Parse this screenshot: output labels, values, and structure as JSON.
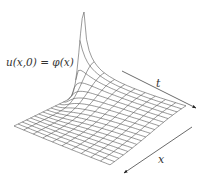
{
  "diagram": {
    "type": "surface-plot",
    "title": "",
    "initial_condition_label": "u(x,0) = φ(x)",
    "axes": [
      {
        "name": "t",
        "label": "t"
      },
      {
        "name": "x",
        "label": "x"
      }
    ],
    "grid": {
      "x_lines": 18,
      "t_lines": 11
    },
    "colors": {
      "mesh": "#555555",
      "arrows": "#444444",
      "text": "#333333"
    }
  }
}
